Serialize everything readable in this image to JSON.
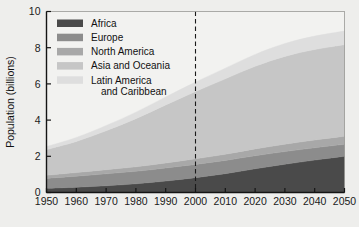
{
  "chart_data": {
    "type": "area",
    "stacked": true,
    "title": "",
    "subtitle": "",
    "xlabel": "",
    "ylabel": "Population (billions)",
    "xlim": [
      1950,
      2050
    ],
    "ylim": [
      0,
      10
    ],
    "xticks": [
      1950,
      1960,
      1970,
      1980,
      1990,
      2000,
      2010,
      2020,
      2030,
      2040,
      2050
    ],
    "xticklabels": [
      "1950",
      "1960",
      "1970",
      "1980",
      "1990",
      "2000",
      "2010",
      "2020",
      "2030",
      "2040",
      "2050"
    ],
    "yticks": [
      0,
      2,
      4,
      6,
      8,
      10
    ],
    "yticklabels": [
      "0",
      "2",
      "4",
      "6",
      "8",
      "10"
    ],
    "grid": false,
    "legend_position": "top-left",
    "x": [
      1950,
      1960,
      1970,
      1980,
      1990,
      2000,
      2010,
      2020,
      2030,
      2040,
      2050
    ],
    "series": [
      {
        "name": "Africa",
        "color": "#4a4a4a",
        "values": [
          0.23,
          0.29,
          0.37,
          0.48,
          0.63,
          0.82,
          1.04,
          1.31,
          1.56,
          1.79,
          2.0
        ]
      },
      {
        "name": "Europe",
        "color": "#8c8c8c",
        "values": [
          0.55,
          0.61,
          0.66,
          0.69,
          0.72,
          0.73,
          0.73,
          0.72,
          0.7,
          0.68,
          0.66
        ]
      },
      {
        "name": "North America",
        "color": "#a8a8a8",
        "values": [
          0.17,
          0.2,
          0.23,
          0.25,
          0.28,
          0.31,
          0.34,
          0.38,
          0.41,
          0.43,
          0.45
        ]
      },
      {
        "name": "Asia and Oceania",
        "color": "#c6c6c6",
        "values": [
          1.42,
          1.72,
          2.15,
          2.66,
          3.21,
          3.72,
          4.17,
          4.56,
          4.85,
          5.0,
          5.05
        ]
      },
      {
        "name": "Latin America and Caribbean",
        "color": "#dedede",
        "values": [
          0.17,
          0.22,
          0.29,
          0.36,
          0.44,
          0.52,
          0.59,
          0.66,
          0.71,
          0.74,
          0.76
        ]
      }
    ],
    "annotations": [
      {
        "type": "vertical-dashed-line",
        "x": 2000,
        "label": ""
      }
    ],
    "totals_note": {
      "1950": 2.54,
      "2000": 6.1,
      "2050": 8.92
    }
  },
  "legend": {
    "entries": [
      {
        "label": "Africa",
        "color": "#4a4a4a"
      },
      {
        "label": "Europe",
        "color": "#8c8c8c"
      },
      {
        "label": "North America",
        "color": "#a8a8a8"
      },
      {
        "label": "Asia and Oceania",
        "color": "#c6c6c6"
      },
      {
        "label": "Latin America",
        "label2": "and Caribbean",
        "color": "#dedede"
      }
    ]
  },
  "axes": {
    "y_title": "Population (billions)"
  },
  "colors": {
    "background": "#eeeeec",
    "plot_background": "#f2f2f0",
    "axis": "#141414",
    "text": "#111111",
    "dashed_line": "#1a1a1a"
  }
}
